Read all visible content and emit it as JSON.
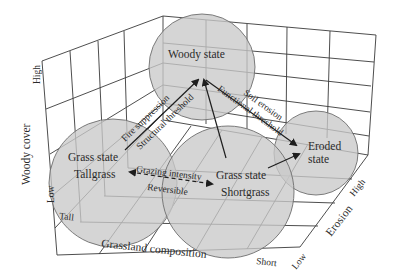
{
  "diagram": {
    "type": "state-and-transition 3D model",
    "axes": {
      "vertical": {
        "label": "Woody cover",
        "low": "Low",
        "high": "High"
      },
      "horizontal": {
        "label": "Grassland composition",
        "start": "Tall",
        "end": "Short"
      },
      "depth": {
        "label": "Erosion",
        "low": "Low",
        "high": "High"
      }
    },
    "states": [
      {
        "id": "woody",
        "line1": "Woody state",
        "line2": ""
      },
      {
        "id": "grass-tall",
        "line1": "Grass state",
        "line2": "Tallgrass"
      },
      {
        "id": "grass-short",
        "line1": "Grass state",
        "line2": "Shortgrass"
      },
      {
        "id": "eroded",
        "line1": "Eroded",
        "line2": "state"
      }
    ],
    "transitions": [
      {
        "from": "grass-tall",
        "to": "woody",
        "label_top": "Fire suppression",
        "label_bottom": "Structural threshold"
      },
      {
        "from": "woody",
        "to": "eroded",
        "label_top": "Soil erosion",
        "label_bottom": "Functional threshold"
      },
      {
        "from": "grass-tall",
        "to": "grass-short",
        "label_top": "Grazing intensity",
        "label_bottom": "Reversible",
        "style": "dashed-bidirectional"
      },
      {
        "from": "grass-short",
        "to": "woody",
        "label_top": "",
        "label_bottom": ""
      },
      {
        "from": "grass-short",
        "to": "eroded",
        "label_top": "",
        "label_bottom": ""
      }
    ],
    "colors": {
      "circle_fill": "#c9c9c9",
      "grid": "#3a3a3a",
      "text": "#2a2a2a"
    }
  }
}
